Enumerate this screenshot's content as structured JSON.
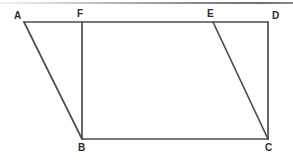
{
  "figure": {
    "background_color": "#ffffff",
    "stroke_color": "#4d4d4d",
    "label_color": "#2b2b2b",
    "canvas": {
      "width": 293,
      "height": 160
    },
    "top_rule": {
      "color": "#8a8a8a",
      "y": 2,
      "height": 2
    },
    "points": {
      "A": {
        "label": "A",
        "x": 24,
        "y": 22,
        "label_x": 14,
        "label_y": 11
      },
      "B": {
        "label": "B",
        "x": 82,
        "y": 139,
        "label_x": 78,
        "label_y": 143
      },
      "C": {
        "label": "C",
        "x": 268,
        "y": 139,
        "label_x": 265,
        "label_y": 143
      },
      "D": {
        "label": "D",
        "x": 268,
        "y": 22,
        "label_x": 272,
        "label_y": 11
      },
      "E": {
        "label": "E",
        "x": 213,
        "y": 22,
        "label_x": 207,
        "label_y": 9
      },
      "F": {
        "label": "F",
        "x": 82,
        "y": 22,
        "label_x": 77,
        "label_y": 9
      }
    },
    "segments": [
      {
        "name": "segment-AD",
        "from": "A",
        "to": "D"
      },
      {
        "name": "segment-AB",
        "from": "A",
        "to": "B"
      },
      {
        "name": "segment-BC",
        "from": "B",
        "to": "C"
      },
      {
        "name": "segment-DC",
        "from": "D",
        "to": "C"
      },
      {
        "name": "segment-FB",
        "from": "F",
        "to": "B"
      },
      {
        "name": "segment-EC",
        "from": "E",
        "to": "C"
      }
    ],
    "labels_order": [
      "A",
      "F",
      "E",
      "D",
      "B",
      "C"
    ]
  }
}
